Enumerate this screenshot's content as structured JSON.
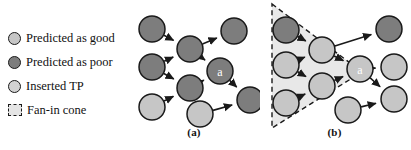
{
  "figure": {
    "width": 411,
    "height": 150,
    "background": "#ffffff"
  },
  "legend": {
    "items": [
      {
        "icon": "circle-light-gray-icon",
        "label": "Predicted as good",
        "color": "#c6c6c6"
      },
      {
        "icon": "circle-dark-gray-icon",
        "label": "Predicted as poor",
        "color": "#7d7d7d"
      },
      {
        "icon": "circle-light-gray-icon",
        "label": "Inserted TP",
        "color": "#d2d2d2"
      },
      {
        "icon": "dashed-square-icon",
        "label": "Fan-in cone",
        "color": "#e4e4e4"
      }
    ]
  },
  "panels": [
    {
      "id": "a",
      "caption": "(a)",
      "has_cone": false,
      "nodes": [
        {
          "id": "a-l1",
          "label": "",
          "type": "poor",
          "cx": 24,
          "cy": 29
        },
        {
          "id": "a-l2",
          "label": "",
          "type": "poor",
          "cx": 24,
          "cy": 67
        },
        {
          "id": "a-l3",
          "label": "",
          "type": "good",
          "cx": 24,
          "cy": 107
        },
        {
          "id": "a-m1",
          "label": "",
          "type": "poor",
          "cx": 62,
          "cy": 49
        },
        {
          "id": "a-m2",
          "label": "",
          "type": "poor",
          "cx": 62,
          "cy": 88
        },
        {
          "id": "a-tr",
          "label": "",
          "type": "poor",
          "cx": 106,
          "cy": 31
        },
        {
          "id": "a-aa",
          "label": "a",
          "type": "poor",
          "cx": 92,
          "cy": 71
        },
        {
          "id": "a-b1",
          "label": "",
          "type": "good",
          "cx": 72,
          "cy": 114
        },
        {
          "id": "a-rr",
          "label": "",
          "type": "poor",
          "cx": 122,
          "cy": 100
        }
      ],
      "edges": [
        [
          "a-l1",
          "a-m1"
        ],
        [
          "a-l2",
          "a-m1"
        ],
        [
          "a-l2",
          "a-m2"
        ],
        [
          "a-l3",
          "a-m2"
        ],
        [
          "a-m1",
          "a-tr"
        ],
        [
          "a-m1",
          "a-aa"
        ],
        [
          "a-m2",
          "a-aa"
        ],
        [
          "a-aa",
          "a-rr"
        ],
        [
          "a-b1",
          "a-rr"
        ]
      ]
    },
    {
      "id": "b",
      "caption": "(b)",
      "has_cone": true,
      "cone": {
        "apex_x": 104,
        "apex_y": 72,
        "top_x": 14,
        "top_y": 4,
        "bottom_x": 14,
        "bottom_y": 128
      },
      "nodes": [
        {
          "id": "b-l1",
          "label": "",
          "type": "poor",
          "cx": 28,
          "cy": 30
        },
        {
          "id": "b-l2",
          "label": "",
          "type": "good",
          "cx": 28,
          "cy": 65
        },
        {
          "id": "b-l3",
          "label": "",
          "type": "good",
          "cx": 28,
          "cy": 103
        },
        {
          "id": "b-m1",
          "label": "",
          "type": "good",
          "cx": 64,
          "cy": 50
        },
        {
          "id": "b-m2",
          "label": "",
          "type": "good",
          "cx": 64,
          "cy": 86
        },
        {
          "id": "b-aa",
          "label": "a",
          "type": "good",
          "cx": 102,
          "cy": 69
        },
        {
          "id": "b-tr",
          "label": "",
          "type": "poor",
          "cx": 131,
          "cy": 29
        },
        {
          "id": "b-r1",
          "label": "",
          "type": "good",
          "cx": 136,
          "cy": 67
        },
        {
          "id": "b-r2",
          "label": "",
          "type": "good",
          "cx": 136,
          "cy": 99
        },
        {
          "id": "b-b1",
          "label": "",
          "type": "good",
          "cx": 90,
          "cy": 110
        }
      ],
      "edges": [
        [
          "b-l1",
          "b-m1"
        ],
        [
          "b-l2",
          "b-m1"
        ],
        [
          "b-l2",
          "b-m2"
        ],
        [
          "b-l3",
          "b-m2"
        ],
        [
          "b-m1",
          "b-tr"
        ],
        [
          "b-m1",
          "b-aa"
        ],
        [
          "b-m2",
          "b-aa"
        ],
        [
          "b-aa",
          "b-r1"
        ],
        [
          "b-aa",
          "b-r2"
        ],
        [
          "b-b1",
          "b-r2"
        ]
      ]
    }
  ],
  "style": {
    "node_radius": 13,
    "node_stroke": "#1a1a1a",
    "edge_color": "#1a1a1a",
    "cone_fill": "#e8e8e8",
    "label_text_color": "#ffffff"
  }
}
